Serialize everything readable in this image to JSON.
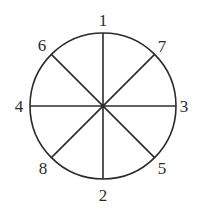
{
  "diagram": {
    "type": "circle-divided-into-sectors",
    "center": [
      103,
      106
    ],
    "radius": 73,
    "stroke_color": "#2b2b2b",
    "background": "#ffffff",
    "diameters": [
      {
        "from": "1",
        "to": "2",
        "orientation": "vertical"
      },
      {
        "from": "4",
        "to": "3",
        "orientation": "horizontal"
      },
      {
        "from": "6",
        "to": "5",
        "orientation": "diagonal-down"
      },
      {
        "from": "8",
        "to": "7",
        "orientation": "diagonal-up"
      }
    ],
    "labels": [
      {
        "text": "1",
        "position": "top"
      },
      {
        "text": "7",
        "position": "top-right"
      },
      {
        "text": "3",
        "position": "right"
      },
      {
        "text": "5",
        "position": "bottom-right"
      },
      {
        "text": "2",
        "position": "bottom"
      },
      {
        "text": "8",
        "position": "bottom-left"
      },
      {
        "text": "4",
        "position": "left"
      },
      {
        "text": "6",
        "position": "top-left"
      }
    ]
  }
}
